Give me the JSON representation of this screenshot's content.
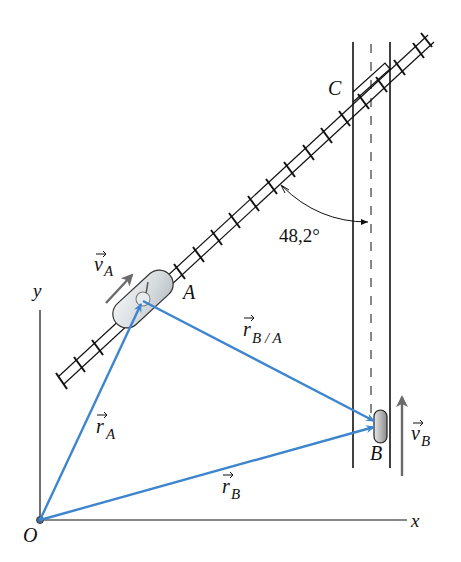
{
  "diagram": {
    "type": "kinematics-relative-motion",
    "labels": {
      "origin": "O",
      "x_axis": "x",
      "y_axis": "y",
      "point_a": "A",
      "point_b": "B",
      "point_c": "C",
      "angle": "48,2°",
      "vec_ra_main": "r",
      "vec_ra_sub": "A",
      "vec_rb_main": "r",
      "vec_rb_sub": "B",
      "vec_rba_main": "r",
      "vec_rba_sub": "B / A",
      "vel_a_main": "v",
      "vel_a_sub": "A",
      "vel_b_main": "v",
      "vel_b_sub": "B"
    },
    "colors": {
      "vector_blue": "#3d86cf",
      "velocity_gray": "#6b6b6b",
      "line_black": "#111111",
      "vehicle_fill": "#d9dde0"
    },
    "elements": [
      "railroad track at 48,2° from road",
      "vertical road with dashed centerline",
      "vehicle A on track",
      "vehicle B on road",
      "position vectors rA, rB, rB/A",
      "velocity vectors vA, vB",
      "crossing point C"
    ]
  }
}
